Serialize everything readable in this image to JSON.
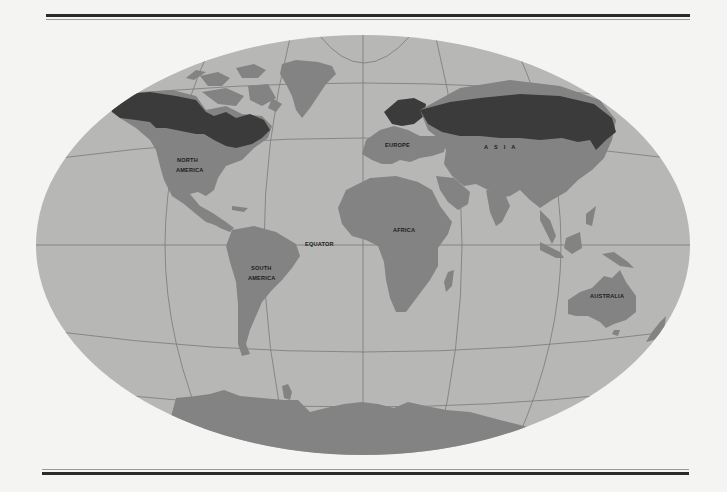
{
  "map": {
    "projection": "world-oval",
    "colors": {
      "background": "#f4f4f3",
      "ocean": "#b7b7b6",
      "land": "#838383",
      "boreal_region": "#3b3b3b",
      "graticule": "#7a7a7a",
      "rule_dark": "#2a2a2a",
      "rule_light": "#9a9a9a"
    },
    "labels": {
      "north_america_line1": "NORTH",
      "north_america_line2": "AMERICA",
      "south_america_line1": "SOUTH",
      "south_america_line2": "AMERICA",
      "europe": "EUROPE",
      "asia": "ASIA",
      "africa": "AFRICA",
      "australia": "AUSTRALIA",
      "equator": "EQUATOR"
    },
    "legend_regions": [
      "land",
      "boreal forest (shaded dark)",
      "ocean"
    ]
  }
}
